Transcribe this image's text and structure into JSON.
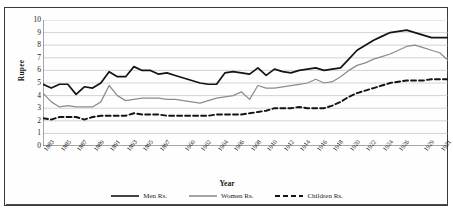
{
  "chart_data": {
    "type": "line",
    "title": "",
    "xlabel": "Year",
    "ylabel": "Rupee",
    "ylim": [
      0,
      10
    ],
    "xlim": [
      1883,
      1932
    ],
    "grid": true,
    "legend_position": "bottom",
    "y_ticks": [
      10,
      9,
      8,
      7,
      6,
      5,
      4,
      3,
      2,
      1,
      0
    ],
    "x_tick_labels": [
      "1883",
      "1885",
      "1887",
      "1889",
      "1891",
      "1893",
      "1895",
      "1897",
      "1900",
      "1902",
      "1904",
      "1906",
      "1908",
      "1910",
      "1912",
      "1914",
      "1916",
      "1918",
      "1920",
      "1922",
      "1924",
      "1926",
      "1929",
      "1931"
    ],
    "x": [
      1883,
      1884,
      1885,
      1886,
      1887,
      1888,
      1889,
      1890,
      1891,
      1892,
      1893,
      1894,
      1895,
      1896,
      1897,
      1898,
      1899,
      1900,
      1901,
      1902,
      1903,
      1904,
      1905,
      1906,
      1907,
      1908,
      1909,
      1910,
      1911,
      1912,
      1913,
      1914,
      1915,
      1916,
      1917,
      1918,
      1919,
      1920,
      1921,
      1922,
      1923,
      1924,
      1925,
      1926,
      1927,
      1928,
      1929,
      1930,
      1931,
      1932
    ],
    "series": [
      {
        "name": "Men Rs.",
        "color": "#141414",
        "style": "solid",
        "values": [
          4.9,
          4.6,
          4.9,
          4.9,
          4.1,
          4.7,
          4.6,
          5.0,
          5.9,
          5.5,
          5.5,
          6.3,
          6.0,
          6.0,
          5.7,
          5.8,
          5.6,
          5.4,
          5.2,
          5.0,
          4.9,
          4.9,
          5.8,
          5.9,
          5.8,
          5.7,
          6.2,
          5.6,
          6.1,
          5.9,
          5.8,
          6.0,
          6.1,
          6.2,
          6.0,
          6.1,
          6.2,
          6.9,
          7.6,
          8.0,
          8.4,
          8.7,
          9.0,
          9.1,
          9.2,
          9.0,
          8.8,
          8.6,
          8.6,
          8.6
        ]
      },
      {
        "name": "Women Rs.",
        "color": "#8c8c8c",
        "style": "solid",
        "values": [
          4.2,
          3.5,
          3.1,
          3.2,
          3.1,
          3.1,
          3.1,
          3.5,
          4.8,
          4.0,
          3.6,
          3.7,
          3.8,
          3.8,
          3.8,
          3.7,
          3.7,
          3.6,
          3.5,
          3.4,
          3.6,
          3.8,
          3.9,
          4.0,
          4.3,
          3.7,
          4.8,
          4.6,
          4.6,
          4.7,
          4.8,
          4.9,
          5.0,
          5.3,
          5.0,
          5.1,
          5.5,
          6.0,
          6.4,
          6.6,
          6.9,
          7.1,
          7.3,
          7.6,
          7.9,
          8.0,
          7.8,
          7.6,
          7.4,
          6.8
        ]
      },
      {
        "name": "Children Rs.",
        "color": "#141414",
        "style": "dashed",
        "values": [
          2.2,
          2.1,
          2.3,
          2.3,
          2.3,
          2.1,
          2.3,
          2.4,
          2.4,
          2.4,
          2.4,
          2.6,
          2.5,
          2.5,
          2.5,
          2.4,
          2.4,
          2.4,
          2.4,
          2.4,
          2.4,
          2.5,
          2.5,
          2.5,
          2.5,
          2.6,
          2.7,
          2.8,
          3.0,
          3.0,
          3.0,
          3.1,
          3.0,
          3.0,
          3.0,
          3.2,
          3.5,
          3.9,
          4.2,
          4.4,
          4.6,
          4.8,
          5.0,
          5.1,
          5.2,
          5.2,
          5.2,
          5.3,
          5.3,
          5.3
        ]
      }
    ]
  }
}
